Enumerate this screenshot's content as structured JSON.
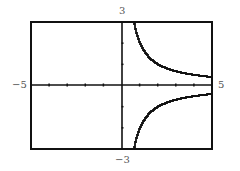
{
  "chart_data": {
    "type": "line",
    "title": "",
    "function": "y = 2/x",
    "xlabel": "",
    "ylabel": "",
    "xlim": [
      -5,
      5
    ],
    "ylim": [
      -3,
      3
    ],
    "xticks_step": 1,
    "yticks_step": 1,
    "grid": false,
    "legend": "none",
    "tick_labels": {
      "xmin": "−5",
      "xmax": "5",
      "ymax": "3",
      "ymin": "−3"
    },
    "series": [
      {
        "name": "upper branch (x>0)",
        "x": [
          0.67,
          0.75,
          1,
          1.5,
          2,
          2.5,
          3,
          3.5,
          4,
          4.5,
          5
        ],
        "values": [
          3,
          2.67,
          2,
          1.33,
          1,
          0.8,
          0.67,
          0.57,
          0.5,
          0.44,
          0.4
        ]
      },
      {
        "name": "lower branch (x>0, mirrored)",
        "x": [
          0.67,
          0.75,
          1,
          1.5,
          2,
          2.5,
          3,
          3.5,
          4,
          4.5,
          5
        ],
        "values": [
          -3,
          -2.67,
          -2,
          -1.33,
          -1,
          -0.8,
          -0.67,
          -0.57,
          -0.5,
          -0.44,
          -0.4
        ]
      }
    ]
  },
  "labels": {
    "xmin": "−5",
    "xmax": "5",
    "ymax": "3",
    "ymin": "−3"
  }
}
